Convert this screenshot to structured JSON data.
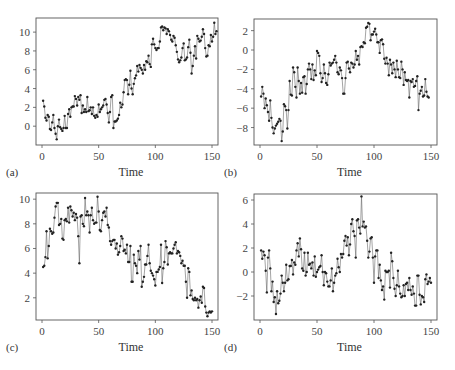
{
  "chart_data": [
    {
      "panel": "(a)",
      "type": "line",
      "xlabel": "Time",
      "ylabel": "",
      "xlim": [
        0,
        150
      ],
      "ylim": [
        -2,
        11.5
      ],
      "xticks": [
        0,
        50,
        100,
        150
      ],
      "yticks": [
        0,
        2,
        4,
        6,
        8,
        10
      ],
      "markers": true,
      "grid": false,
      "frame": {
        "left": 36,
        "top": 18,
        "right": 218,
        "bottom": 145
      },
      "values": [
        2.7,
        2.1,
        0.9,
        0.6,
        1.2,
        1.0,
        -0.3,
        -0.4,
        0.4,
        1.2,
        -0.2,
        -0.8,
        -1.4,
        0.0,
        0.7,
        -0.1,
        -0.3,
        -0.5,
        -0.2,
        1.1,
        -0.2,
        -0.2,
        1.3,
        1.8,
        1.0,
        2.0,
        2.1,
        2.1,
        3.2,
        2.9,
        2.2,
        3.1,
        2.8,
        3.3,
        1.4,
        2.2,
        1.5,
        1.8,
        1.5,
        3.1,
        1.6,
        1.7,
        2.0,
        1.3,
        2.0,
        1.1,
        0.9,
        1.2,
        1.0,
        2.3,
        1.5,
        1.8,
        2.0,
        2.2,
        2.8,
        2.9,
        2.3,
        1.4,
        0.4,
        1.5,
        3.1,
        3.3,
        -0.2,
        0.5,
        0.5,
        0.6,
        0.8,
        1.2,
        2.5,
        2.0,
        2.3,
        3.6,
        4.9,
        5.0,
        4.9,
        3.4,
        4.4,
        5.9,
        4.0,
        3.4,
        4.5,
        5.1,
        5.4,
        6.4,
        5.8,
        6.5,
        6.2,
        6.0,
        5.6,
        6.5,
        6.0,
        6.9,
        6.8,
        7.5,
        6.6,
        6.3,
        8.7,
        9.3,
        8.7,
        8.3,
        8.1,
        8.3,
        8.3,
        9.0,
        10.5,
        10.6,
        10.2,
        10.5,
        10.4,
        9.8,
        10.3,
        10.1,
        9.7,
        9.2,
        9.0,
        9.6,
        9.4,
        8.6,
        7.9,
        7.1,
        6.8,
        7.0,
        7.3,
        8.3,
        8.8,
        7.0,
        7.1,
        7.3,
        8.4,
        9.2,
        7.8,
        5.6,
        6.4,
        7.5,
        8.5,
        7.2,
        9.6,
        9.3,
        9.0,
        9.1,
        9.5,
        10.3,
        9.8,
        8.3,
        7.4,
        7.5,
        8.6,
        8.5,
        9.7,
        9.0,
        9.5,
        11.0,
        9.8,
        10.1
      ]
    },
    {
      "panel": "(b)",
      "type": "line",
      "xlabel": "Time",
      "ylabel": "",
      "xlim": [
        0,
        150
      ],
      "ylim": [
        -9.8,
        3.2
      ],
      "xticks": [
        0,
        50,
        100,
        150
      ],
      "yticks": [
        -8,
        -6,
        -4,
        -2,
        0,
        2
      ],
      "markers": true,
      "grid": false,
      "frame": {
        "left": 254,
        "top": 19,
        "right": 437,
        "bottom": 145
      },
      "values": [
        -4.8,
        -3.8,
        -4.5,
        -6.0,
        -5.0,
        -5.7,
        -6.4,
        -7.3,
        -5.2,
        -7.0,
        -8.0,
        -8.6,
        -8.1,
        -7.8,
        -7.6,
        -7.4,
        -7.1,
        -7.3,
        -9.4,
        -8.4,
        -5.6,
        -5.8,
        -6.2,
        -8.1,
        -6.2,
        -3.2,
        -4.6,
        -4.7,
        -1.8,
        -2.3,
        -3.8,
        -4.9,
        -1.8,
        -3.2,
        -4.5,
        -3.4,
        -4.4,
        -2.8,
        -2.7,
        -4.5,
        -3.5,
        -2.0,
        -1.4,
        -2.0,
        -3.0,
        -1.5,
        -3.1,
        -2.1,
        -2.6,
        -0.1,
        -0.3,
        -0.6,
        -2.4,
        -3.3,
        -2.9,
        -1.5,
        -2.4,
        -3.4,
        -3.6,
        -2.5,
        -1.3,
        -1.6,
        -1.4,
        -1.3,
        -1.0,
        -0.6,
        -1.3,
        -2.3,
        -2.5,
        -1.8,
        -2.1,
        -2.9,
        -4.5,
        -4.5,
        -2.9,
        -1.3,
        -1.2,
        -1.9,
        -2.3,
        -1.3,
        -1.4,
        -1.8,
        -1.5,
        -0.1,
        -1.0,
        -0.6,
        -1.5,
        0.3,
        0.4,
        0.3,
        0.8,
        0.7,
        2.3,
        2.4,
        2.8,
        2.7,
        1.0,
        1.6,
        1.6,
        1.9,
        2.2,
        1.6,
        0.8,
        0.8,
        -0.3,
        1.0,
        1.1,
        0.6,
        -0.9,
        -1.4,
        -0.8,
        -1.4,
        -2.6,
        -1.0,
        -1.5,
        -2.4,
        -1.3,
        -2.0,
        -2.8,
        -1.1,
        -2.0,
        -2.8,
        -2.9,
        -1.2,
        -2.0,
        -3.6,
        -2.3,
        -3.1,
        -3.2,
        -3.1,
        -4.9,
        -3.2,
        -3.3,
        -3.0,
        -3.8,
        -3.7,
        -3.2,
        -2.7,
        -6.2,
        -4.5,
        -4.2,
        -3.8,
        -4.8,
        -4.7,
        -3.0,
        -4.3,
        -4.8,
        -4.9
      ]
    },
    {
      "panel": "(c)",
      "type": "line",
      "xlabel": "Time",
      "ylabel": "",
      "xlim": [
        0,
        150
      ],
      "ylim": [
        0.2,
        10.5
      ],
      "xticks": [
        0,
        50,
        100,
        150
      ],
      "yticks": [
        2,
        4,
        6,
        8,
        10
      ],
      "markers": true,
      "grid": false,
      "frame": {
        "left": 36,
        "top": 193,
        "right": 218,
        "bottom": 320
      },
      "values": [
        4.5,
        4.6,
        5.3,
        7.4,
        5.2,
        6.2,
        7.6,
        7.4,
        7.2,
        7.3,
        8.5,
        9.4,
        9.7,
        9.7,
        7.9,
        8.0,
        8.4,
        6.8,
        6.7,
        8.3,
        8.4,
        8.2,
        9.3,
        8.1,
        9.4,
        9.1,
        8.6,
        8.9,
        8.3,
        8.8,
        8.5,
        7.0,
        4.8,
        8.6,
        8.7,
        8.0,
        7.8,
        10.1,
        8.7,
        9.0,
        8.7,
        7.3,
        8.7,
        9.3,
        8.3,
        8.0,
        8.1,
        8.1,
        10.2,
        9.0,
        7.5,
        7.4,
        8.3,
        8.9,
        9.0,
        8.6,
        9.3,
        7.9,
        7.7,
        6.6,
        6.3,
        6.6,
        6.7,
        6.7,
        6.0,
        6.4,
        5.5,
        5.7,
        6.2,
        7.0,
        6.8,
        5.8,
        5.9,
        5.6,
        6.3,
        4.9,
        4.9,
        6.2,
        3.3,
        3.3,
        5.5,
        4.8,
        4.6,
        4.0,
        5.8,
        5.1,
        6.2,
        2.9,
        3.3,
        3.7,
        4.7,
        4.7,
        5.4,
        6.3,
        4.8,
        4.2,
        4.0,
        3.8,
        3.5,
        3.0,
        4.1,
        4.1,
        4.3,
        4.5,
        6.3,
        3.2,
        4.4,
        4.9,
        6.6,
        6.1,
        4.7,
        5.6,
        5.7,
        5.6,
        5.6,
        6.0,
        6.3,
        6.5,
        5.6,
        5.8,
        5.7,
        5.4,
        4.8,
        5.0,
        4.6,
        4.6,
        3.3,
        2.0,
        4.4,
        4.1,
        2.2,
        2.6,
        1.9,
        1.8,
        2.0,
        1.8,
        1.9,
        1.2,
        1.8,
        2.1,
        1.6,
        2.9,
        2.8,
        1.3,
        0.8,
        0.5,
        0.8,
        0.9,
        0.8,
        0.9
      ]
    },
    {
      "panel": "(d)",
      "type": "line",
      "xlabel": "Time",
      "ylabel": "",
      "xlim": [
        0,
        150
      ],
      "ylim": [
        -4,
        6.5
      ],
      "xticks": [
        0,
        50,
        100,
        150
      ],
      "yticks": [
        -2,
        0,
        2,
        4,
        6
      ],
      "markers": true,
      "grid": false,
      "frame": {
        "left": 254,
        "top": 194,
        "right": 437,
        "bottom": 320
      },
      "values": [
        1.8,
        1.1,
        1.7,
        1.4,
        0.1,
        -1.7,
        1.2,
        1.8,
        0.3,
        -1.6,
        -0.8,
        -2.5,
        -2.1,
        -3.5,
        -1.6,
        -2.6,
        -2.4,
        -1.8,
        -0.3,
        -0.9,
        -1.6,
        -0.9,
        0.6,
        -0.7,
        -0.6,
        0.5,
        0.5,
        1.0,
        -0.2,
        0.8,
        0.6,
        1.8,
        2.4,
        1.3,
        2.8,
        1.9,
        0.3,
        0.1,
        1.6,
        -0.3,
        0.0,
        1.6,
        0.6,
        0.7,
        0.3,
        0.8,
        -0.3,
        1.3,
        -0.4,
        0.0,
        0.2,
        0.4,
        0.5,
        1.4,
        0.0,
        -1.1,
        0.0,
        -0.1,
        -0.8,
        -1.2,
        -1.2,
        -0.7,
        0.3,
        -1.6,
        -0.9,
        -0.3,
        -0.1,
        1.1,
        0.4,
        0.0,
        1.5,
        1.2,
        1.5,
        2.6,
        3.0,
        2.2,
        2.9,
        1.4,
        2.3,
        4.0,
        4.4,
        3.4,
        3.0,
        1.2,
        4.3,
        4.4,
        3.7,
        3.2,
        6.3,
        3.8,
        4.2,
        3.7,
        3.8,
        2.6,
        1.2,
        1.7,
        2.8,
        2.9,
        1.2,
        -0.9,
        1.3,
        1.8,
        1.8,
        -0.5,
        0.6,
        -0.7,
        -1.5,
        -1.2,
        -2.3,
        0.1,
        0.0,
        0.0,
        0.1,
        -1.3,
        1.6,
        0.9,
        -0.5,
        -1.4,
        -2.0,
        -1.1,
        0.1,
        -1.2,
        -1.8,
        -2.1,
        -2.0,
        -1.1,
        -2.0,
        -1.0,
        -0.9,
        -1.5,
        -0.5,
        -1.5,
        -1.9,
        -1.2,
        -1.8,
        -2.8,
        -2.8,
        -0.3,
        -0.3,
        -1.9,
        -2.7,
        -2.0,
        -2.1,
        -2.5,
        -0.6,
        -0.2,
        -1.0,
        -0.8,
        -0.5,
        -0.9
      ]
    }
  ]
}
